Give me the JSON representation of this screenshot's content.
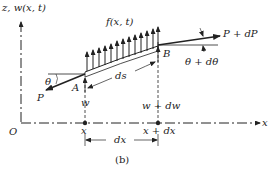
{
  "figure": {
    "caption": "(b)",
    "axes": {
      "vertical_label": "z, w(x, t)",
      "horizontal_label": "x",
      "origin_label": "O"
    },
    "load_label": "f(x, t)",
    "points": {
      "left_end": "A",
      "right_end": "B"
    },
    "forces": {
      "left_tension": "P",
      "right_tension": "P + dP"
    },
    "angles": {
      "left_angle": "θ",
      "right_angle": "θ + dθ"
    },
    "arc_length": "ds",
    "displacements": {
      "left": "w",
      "right": "w + dw"
    },
    "positions": {
      "left": "x",
      "right": "x + dx"
    },
    "element_length": "dx",
    "colors": {
      "line": "#222222",
      "background": "#ffffff"
    }
  }
}
